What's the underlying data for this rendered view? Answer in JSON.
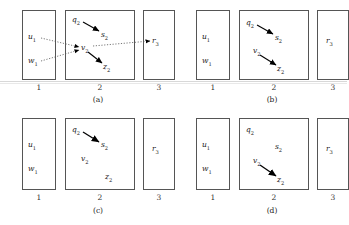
{
  "figure": {
    "type": "diagram",
    "panel_count": 4,
    "column_numbers": [
      "1",
      "2",
      "3"
    ],
    "panels": [
      {
        "caption": "(a)",
        "columns": [
          {
            "number": "1",
            "nodes": [
              "u1",
              "w1"
            ]
          },
          {
            "number": "2",
            "nodes": [
              "q2",
              "s2",
              "v2",
              "z2"
            ]
          },
          {
            "number": "3",
            "nodes": [
              "r3"
            ]
          }
        ],
        "solid_arrows": [
          {
            "from": "q2",
            "to": "s2"
          },
          {
            "from": "v2",
            "to": "z2"
          }
        ],
        "dotted_arrows": [
          {
            "from": "u1",
            "to": "v2"
          },
          {
            "from": "w1",
            "to": "v2"
          },
          {
            "from": "v2",
            "to": "r3"
          }
        ]
      },
      {
        "caption": "(b)",
        "columns": [
          {
            "number": "1",
            "nodes": [
              "u1",
              "w1"
            ]
          },
          {
            "number": "2",
            "nodes": [
              "q2",
              "s2",
              "v2",
              "z2"
            ]
          },
          {
            "number": "3",
            "nodes": [
              "r3"
            ]
          }
        ],
        "solid_arrows": [
          {
            "from": "q2",
            "to": "s2"
          },
          {
            "from": "v2",
            "to": "z2"
          }
        ],
        "dotted_arrows": []
      },
      {
        "caption": "(c)",
        "columns": [
          {
            "number": "1",
            "nodes": [
              "u1",
              "w1"
            ]
          },
          {
            "number": "2",
            "nodes": [
              "q2",
              "s2",
              "v2",
              "z2"
            ]
          },
          {
            "number": "3",
            "nodes": [
              "r3"
            ]
          }
        ],
        "solid_arrows": [
          {
            "from": "q2",
            "to": "s2"
          }
        ],
        "dotted_arrows": []
      },
      {
        "caption": "(d)",
        "columns": [
          {
            "number": "1",
            "nodes": [
              "u1",
              "w1"
            ]
          },
          {
            "number": "2",
            "nodes": [
              "q2",
              "s2",
              "v2",
              "z2"
            ]
          },
          {
            "number": "3",
            "nodes": [
              "r3"
            ]
          }
        ],
        "solid_arrows": [
          {
            "from": "v2",
            "to": "z2"
          }
        ],
        "dotted_arrows": []
      }
    ]
  },
  "labels": {
    "u1": {
      "base": "u",
      "sub": "1"
    },
    "w1": {
      "base": "w",
      "sub": "1"
    },
    "q2": {
      "base": "q",
      "sub": "2"
    },
    "s2": {
      "base": "s",
      "sub": "2"
    },
    "v2": {
      "base": "v",
      "sub": "2"
    },
    "z2": {
      "base": "z",
      "sub": "2"
    },
    "r3": {
      "base": "r",
      "sub": "3"
    }
  },
  "captions": {
    "a": "(a)",
    "b": "(b)",
    "c": "(c)",
    "d": "(d)"
  },
  "colors": {
    "box_stroke": "#555555",
    "arrow": "#000000",
    "dotted": "#555555",
    "text": "#1a1a1a",
    "background": "#ffffff",
    "scanline": "#d8d8d8"
  }
}
